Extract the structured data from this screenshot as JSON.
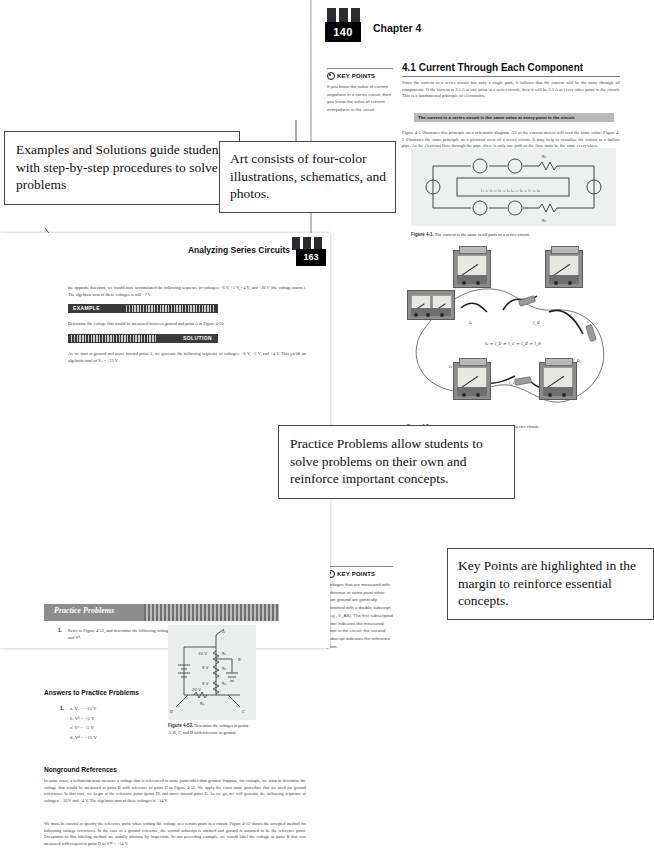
{
  "callouts": [
    {
      "id": "examples",
      "text": "Examples and Solutions guide students with step-by-step procedures to solve problems"
    },
    {
      "id": "art",
      "text": "Art consists of four-color illustrations, schematics, and photos."
    },
    {
      "id": "practice",
      "text": "Practice Problems allow students to solve problems on their own and reinforce important concepts."
    },
    {
      "id": "keypoints",
      "text": "Key Points are highlighted in the margin to reinforce essential concepts."
    }
  ],
  "right_page": {
    "folio": "140",
    "chapter": "Chapter 4",
    "section_heading": "4.1  Current Through Each Component",
    "para1": "Since the current in a series circuit has only a single path, it follows that the current will be the same through all components. If the current is 2.5 A at one point in a series circuit, then it will be 2.5 A at every other point in the circuit. This is a fundamental principle of electronics.",
    "rule": "The current in a series circuit is the same value at every point in the circuit.",
    "para2": "Figure 4-1 illustrates this principle on a schematic diagram. All of the current meters will read the same value. Figure 4-2 illustrates the same principle on a pictorial view of a series circuit. It may help to visualize the circuit as a hollow pipe. As the electrons flow through the pipe, there is only one path so the flow must be the same everywhere.",
    "key_points": [
      {
        "title": "KEY POINTS",
        "text": "If you know the value of current anywhere in a series circuit, then you know the value of current everywhere in the circuit."
      },
      {
        "title": "KEY POINTS",
        "text": "Voltages that are measured with reference to some point other than ground are generally identified with a double subscript (e.g., V_AB). The first subscripted letter indicates the measured point in the circuit; the second subscript indicates the reference point."
      }
    ],
    "figures": [
      {
        "number": "Figure 4-1.",
        "caption": "The current is the same in all parts of a series circuit.",
        "equation": "I₁ = I₂ = I₃ = I₄ = I₅ = I₆ = I₇ = I₈",
        "resistor_labels": [
          "R₁",
          "R₂",
          "R₃",
          "R₄"
        ]
      },
      {
        "number": "Figure 4-2.",
        "caption": "A pictorial drawing that shows the current in a series circuit.",
        "equation": "Iₐ = Iᵇ = Iᶜ = Iᵈ = Iₑ",
        "current_labels": [
          "Iₐ",
          "Iᵇ",
          "Iᶜ",
          "Iᵈ",
          "Iₑ"
        ]
      }
    ]
  },
  "left_page": {
    "folio": "163",
    "running_head": "Analyzing Series Circuits",
    "para_top": "the opposite direction, we would have accumulated the following sequence of voltages: −6 V, +1 V, −4 V, and −20 V (the voltage source). The algebraic sum of these voltages is still −7 V.",
    "tags": [
      {
        "label": "EXAMPLE",
        "align": "left"
      },
      {
        "label": "SOLUTION",
        "align": "right"
      }
    ],
    "para_example": "Determine the voltage that would be measured between ground and point A in Figure 4-50.",
    "para_solution": "As we start at ground and move toward point A, we generate the following sequence of voltages: +6 V, +3 V, and +4 V. This yields an algebraic total of Vₐ = +13 V.",
    "practice_banner": "Practice Problems",
    "practice_item_number": "1.",
    "practice_item": "Refer to Figure 4-53, and determine the following voltages: Vₐ, Vᵇ, Vᶜ, and Vᵈ.",
    "answers_heading": "Answers to Practice Problems",
    "answers_number": "1.",
    "answers": [
      "a. Vₐ = −15 V",
      "b. Vᵇ = −5 V",
      "c. Vᶜ = +5 V",
      "d. Vᵈ = +15 V"
    ],
    "nonground_heading": "Nonground References",
    "nonground_para1": "In some cases, a technician must measure a voltage that is referenced to some point other than ground. Suppose, for example, we want to determine the voltage that would be measured at point B with reference to point D in Figure 4-52. We apply the exact same procedure that we used for ground references. In this case, we begin at the reference point (point D) and move toward point B. As we go, we will generate the following sequence of voltages: +10 V and +4 V. The algebraic sum of these voltages is +14 V.",
    "nonground_para2": "We must be careful to specify the reference point when writing the voltage at a certain point in a circuit. Figure 4-53 shows the accepted method for indicating voltage references. In the case of a ground reference, the second subscript is omitted and ground is assumed to be the reference point. Exceptions to this labeling method are usually obvious by inspection. In our preceding example, we would label the voltage at point B that was measured with respect to point D as Vᵇᵈ = +14 V.",
    "figure": {
      "number": "Figure 4-53.",
      "caption": "Determine the voltages at points A, B, C, and D with reference to ground.",
      "values": [
        "10 V",
        "5 V",
        "5 V",
        "20 V"
      ],
      "nodes": [
        "A",
        "B",
        "C",
        "D"
      ],
      "resistors": [
        "R₁",
        "R₂",
        "R₃",
        "R₄"
      ]
    }
  },
  "colors": {
    "page_bg": "#ffffff",
    "rule_bar": "#b9b9b9",
    "tag_bar": "#3a3a3a",
    "banner": "#8d8d8d",
    "figure_bg": "#eef0ef",
    "callout_border": "#4a4a4a",
    "text": "#1a1a1a"
  }
}
